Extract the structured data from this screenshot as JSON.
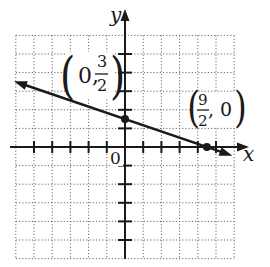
{
  "graph": {
    "type": "line-on-coordinate-grid",
    "axes": {
      "x_label": "x",
      "y_label": "y",
      "origin_label": "0",
      "x_range": [
        -6,
        6
      ],
      "y_range": [
        -6,
        6
      ],
      "grid_step": 1,
      "grid_style": "dotted"
    },
    "line": {
      "equation": "y = -x/3 + 3/2",
      "slope": -0.3333,
      "y_intercept": 1.5,
      "x_intercept": 4.5,
      "arrows": "both-ends",
      "color": "#1a1a1a"
    },
    "points": [
      {
        "x": 0,
        "y": 1.5,
        "label_open": "(",
        "label_first": "0,",
        "label_num": "3",
        "label_den": "2",
        "label_close": ")"
      },
      {
        "x": 4.5,
        "y": 0,
        "label_open": "(",
        "label_num": "9",
        "label_den": "2",
        "label_second": ", 0",
        "label_close": ")"
      }
    ]
  },
  "colors": {
    "ink": "#1a1a1a",
    "grid": "#555555",
    "background": "#ffffff"
  }
}
